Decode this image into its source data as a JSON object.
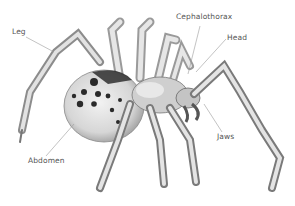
{
  "diagram": {
    "labels": [
      {
        "id": "leg",
        "text": "Leg",
        "x": 12,
        "y": 27
      },
      {
        "id": "cephalothorax",
        "text": "Cephalothorax",
        "x": 176,
        "y": 12
      },
      {
        "id": "head",
        "text": "Head",
        "x": 227,
        "y": 33
      },
      {
        "id": "abdomen",
        "text": "Abdomen",
        "x": 28,
        "y": 156
      },
      {
        "id": "jaws",
        "text": "Jaws",
        "x": 217,
        "y": 132
      }
    ],
    "colors": {
      "background": "#ffffff",
      "label_text": "#555555",
      "leader_line": "#9a9a9a",
      "body_light": "#e4e4e4",
      "body_mid": "#a8a8a8",
      "spots": "#2a2a2a"
    }
  }
}
